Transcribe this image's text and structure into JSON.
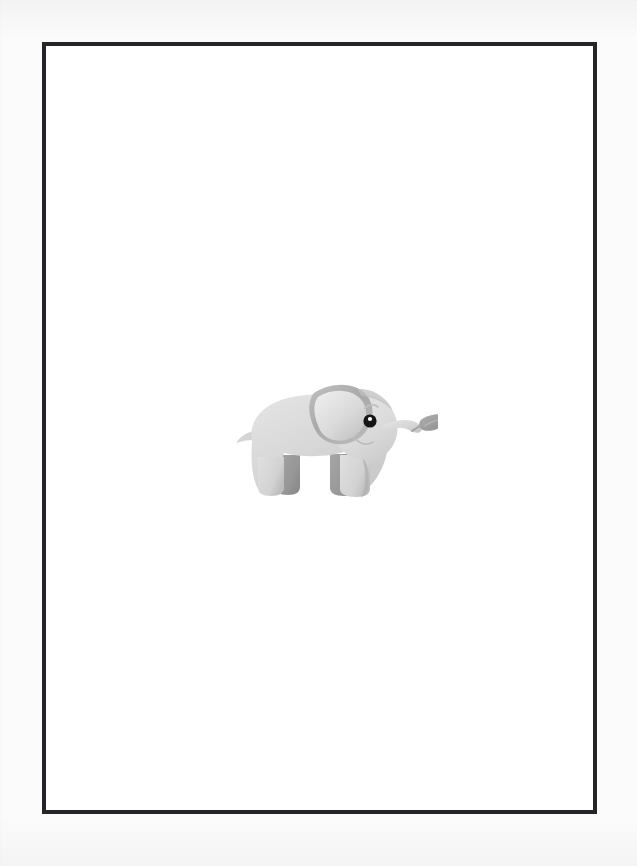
{
  "page": {
    "background_color": "#fbfbfb",
    "width": 637,
    "height": 866,
    "caption": ""
  },
  "frame": {
    "border_color": "#252527",
    "border_width": "4px",
    "fill_color": "#ffffff",
    "left": 42,
    "top": 42,
    "width": 555,
    "height": 772
  },
  "illustration": {
    "subject": "baby elephant",
    "style": "flat cartoon clip-art with soft gradient shading",
    "orientation": "facing right",
    "bounds": {
      "x": 214,
      "y": 355,
      "width": 220,
      "height": 150
    },
    "palette": {
      "body_light": "#dddddd",
      "body_mid": "#d2d2d2",
      "body_shadow": "#c2c2c2",
      "ear_inner": "#c8c8c8",
      "ear_rim": "#a9a9a9",
      "leg_dark": "#9b9b9b",
      "leg_dark_shade": "#8e8e8e",
      "leaf": "#9e9e9e",
      "leaf_shade": "#8b8b8b",
      "eye": "#151515",
      "eye_highlight": "#ffffff",
      "line": "#b4b4b4"
    },
    "parts": [
      {
        "name": "body",
        "label": "Body"
      },
      {
        "name": "head",
        "label": "Head"
      },
      {
        "name": "ear",
        "label": "Ear"
      },
      {
        "name": "eye",
        "label": "Eye"
      },
      {
        "name": "eyelash",
        "label": "Eyelash"
      },
      {
        "name": "mouth",
        "label": "Smile"
      },
      {
        "name": "trunk",
        "label": "Trunk"
      },
      {
        "name": "leaf",
        "label": "Leaf held in trunk"
      },
      {
        "name": "tail",
        "label": "Tail"
      },
      {
        "name": "front-legs",
        "label": "Front legs"
      },
      {
        "name": "rear-legs",
        "label": "Rear legs"
      }
    ]
  }
}
